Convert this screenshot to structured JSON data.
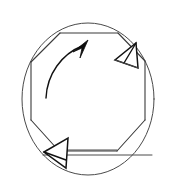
{
  "figure": {
    "title": "Rotation of an octagon inscribed in a circle",
    "type": "line-drawing",
    "background_color": "#ffffff",
    "stroke_color": "#3a3a3a",
    "accent_color": "#0d0d0d",
    "canvas": {
      "width": 175,
      "height": 186
    },
    "elements": {
      "circle": {
        "name": "outer-circle",
        "center_x": 88,
        "center_y": 99,
        "radius_x": 66,
        "radius_y": 76
      },
      "octagon": {
        "name": "inscribed-octagon",
        "sides": 8,
        "points": "60,33 118,33 145,62 145,120 119,151 60,151 31,120 31,62"
      },
      "rotation_arrow": {
        "name": "counterclockwise-rotation-arrow",
        "direction": "clockwise-up-right",
        "path": "46,96 C 48,72 64,54 84,47"
      },
      "arrowhead_top_right": {
        "name": "arrowhead-top-right",
        "orientation": "pointing-down-left"
      },
      "arrowhead_bottom_left": {
        "name": "arrowhead-bottom-left",
        "orientation": "pointing-left"
      },
      "chord_bottom": {
        "name": "bottom-chord-line",
        "y": 155
      }
    }
  }
}
